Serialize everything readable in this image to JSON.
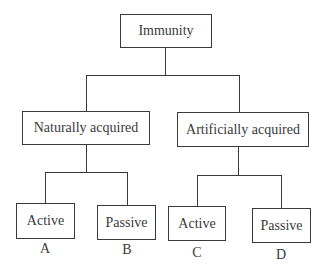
{
  "diagram": {
    "type": "tree",
    "root": {
      "label": "Immunity"
    },
    "branches": [
      {
        "label": "Naturally acquired",
        "children": [
          {
            "label": "Active",
            "marker": "A"
          },
          {
            "label": "Passive",
            "marker": "B"
          }
        ]
      },
      {
        "label": "Artificially acquired",
        "children": [
          {
            "label": "Active",
            "marker": "C"
          },
          {
            "label": "Passive",
            "marker": "D"
          }
        ]
      }
    ],
    "line_color": "#3a3a3a"
  }
}
